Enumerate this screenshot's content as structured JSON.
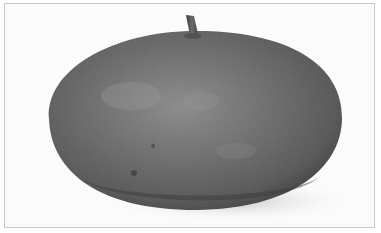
{
  "image": {
    "subject": "gourd",
    "alt": "Black-and-white photograph of a large, flattened round gourd with a short stem on a white background",
    "colors": {
      "background": "#fbfbfb",
      "frame": "#c8c8c8",
      "body_dark": "#4a4a4a",
      "body_mid": "#6b6b6b",
      "body_light": "#8e8e8e",
      "stem": "#555555",
      "shadow": "#d6d6d6"
    }
  }
}
